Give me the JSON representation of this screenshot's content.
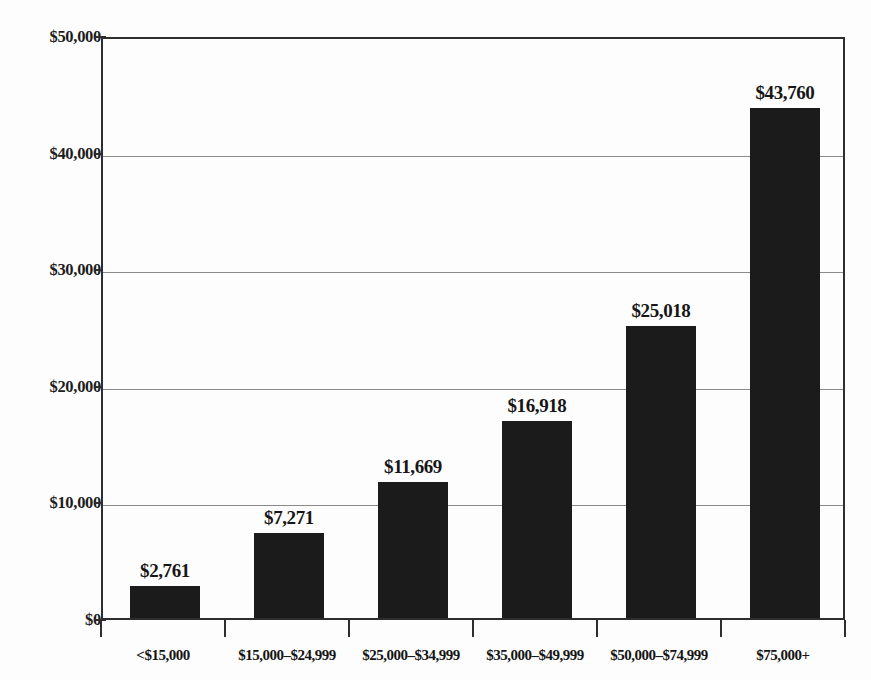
{
  "chart_data": {
    "type": "bar",
    "title": "",
    "xlabel": "",
    "ylabel": "",
    "ylim": [
      0,
      50000
    ],
    "grid": true,
    "legend": false,
    "categories": [
      "<$15,000",
      "$15,000–$24,999",
      "$25,000–$34,999",
      "$35,000–$49,999",
      "$50,000–$74,999",
      "$75,000+"
    ],
    "values": [
      2761,
      7271,
      11669,
      16918,
      25018,
      43760
    ],
    "value_labels": [
      "$2,761",
      "$7,271",
      "$11,669",
      "$16,918",
      "$25,018",
      "$43,760"
    ],
    "ytick_values": [
      0,
      10000,
      20000,
      30000,
      40000,
      50000
    ],
    "ytick_labels": [
      "$0",
      "$10,000",
      "$20,000",
      "$30,000",
      "$40,000",
      "$50,000"
    ],
    "bar_color": "#1b1b1b",
    "grid_color": "#8a8a8a",
    "axis_color": "#2e2e2e",
    "background_color": "#fdfdfd"
  },
  "page": {
    "cut_off_caption": ""
  }
}
